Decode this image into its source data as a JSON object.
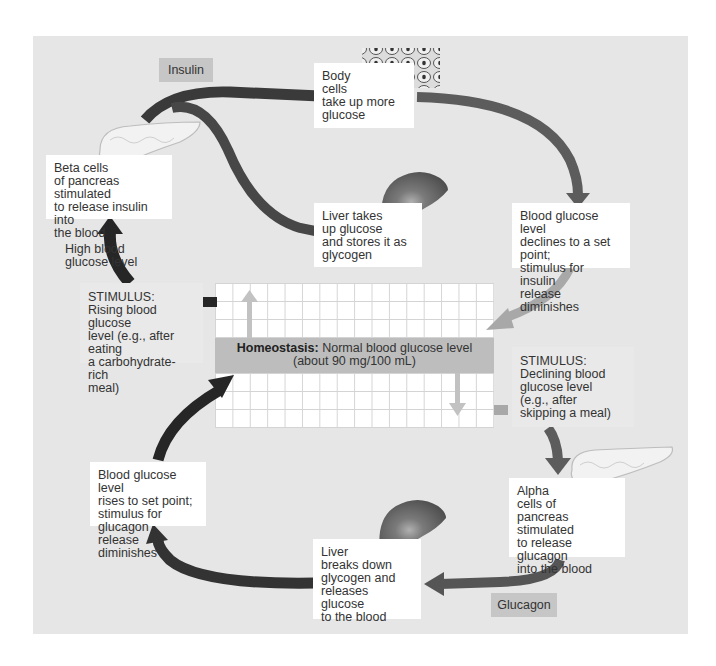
{
  "diagram": {
    "colors": {
      "panel_bg": "#e6e6e6",
      "box_bg": "#ffffff",
      "homeostasis_band": "#bdbdbd",
      "hormone_tag": "#c6c6c6",
      "arrow_dark": "#262626",
      "arrow_mid": "#555555",
      "arrow_light": "#b5b5b5"
    },
    "hormone_tags": {
      "insulin": "Insulin",
      "glucagon": "Glucagon"
    },
    "homeostasis": {
      "label_bold": "Homeostasis:",
      "label_rest": " Normal blood glucose level",
      "value_line": "(about 90 mg/100 mL)"
    },
    "insulin_pathway": {
      "beta_cells": "Beta cells\nof pancreas stimulated\nto release insulin into\nthe blood",
      "body_cells": "Body\ncells\ntake up more\nglucose",
      "liver_takes_up": "Liver takes\nup glucose\nand stores it as\nglycogen",
      "declines": "Blood glucose level\ndeclines to a set point;\nstimulus for insulin\nrelease diminishes",
      "high_blood_glucose": "High blood\nglucose level",
      "stimulus_rising": "STIMULUS:\nRising blood glucose\nlevel (e.g., after eating\na carbohydrate-rich\nmeal)"
    },
    "glucagon_pathway": {
      "stimulus_declining": "STIMULUS:\nDeclining blood\nglucose level\n(e.g., after\nskipping a meal)",
      "alpha_cells": "Alpha\ncells of\npancreas stimulated\nto release glucagon\ninto the blood",
      "liver_breaks_down": "Liver\nbreaks down\nglycogen and\nreleases glucose\nto the blood",
      "rises": "Blood glucose level\nrises to set point;\nstimulus for glucagon\nrelease diminishes"
    },
    "illustrations": [
      "pancreas-top",
      "body-cells",
      "liver-top",
      "pancreas-bottom",
      "liver-bottom"
    ]
  }
}
